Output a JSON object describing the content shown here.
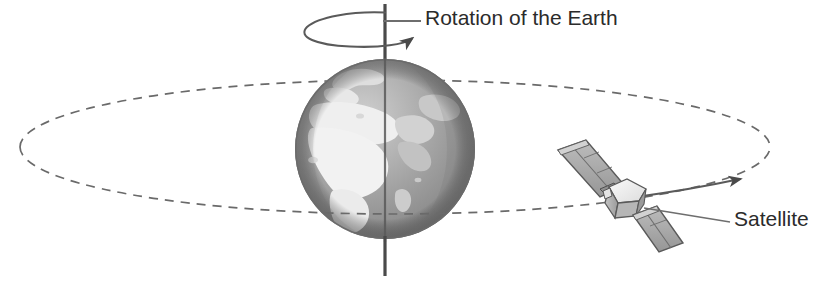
{
  "figure": {
    "background_color": "#ffffff",
    "width": 817,
    "height": 292
  },
  "labels": {
    "rotation": "Rotation of the Earth",
    "satellite": "Satellite"
  },
  "bottom_clipped_caption": "",
  "colors": {
    "line": "#555555",
    "orbit_dash": "#6a6a6a",
    "axis": "#4a4a4a",
    "text": "#2b2b2b",
    "globe_ocean_dark": "#8b8b8b",
    "globe_ocean_mid": "#a6a6a6",
    "globe_land_light": "#ededed",
    "globe_land_mid": "#cfcfcf",
    "globe_shadow": "#6f6f6f",
    "satellite_body_light": "#f2f2f2",
    "satellite_body_mid": "#c9c9c9",
    "satellite_body_dark": "#8e8e8e",
    "panel_fill": "#a9a9a9",
    "panel_stroke": "#5a5a5a"
  },
  "elements": {
    "earth_globe": {
      "name": "earth-globe",
      "center_x": 385,
      "center_y": 149,
      "radius_x": 90,
      "radius_y": 91,
      "continents_visible": "Africa, Europe, Middle East"
    },
    "rotation_axis": {
      "name": "rotation-axis",
      "x": 385,
      "y_top": 4,
      "y_bottom": 275
    },
    "rotation_arrow_ellipse": {
      "name": "rotation-direction-arrow",
      "center_x": 357,
      "center_y": 29,
      "radius_x": 52,
      "radius_y": 17,
      "arrow_direction": "clockwise-viewed-from-above"
    },
    "rotation_leader_line": {
      "name": "rotation-label-leader-line",
      "x1": 385,
      "y1": 21,
      "x2": 420,
      "y2": 21
    },
    "orbit_ellipse": {
      "name": "satellite-orbit-path",
      "center_x": 395,
      "center_y": 147,
      "radius_x": 375,
      "radius_y": 67,
      "style": "dashed"
    },
    "satellite": {
      "name": "satellite",
      "body_center_x": 625,
      "body_center_y": 200,
      "panel_angle_degrees": -38,
      "panel_count": 2
    },
    "satellite_direction_arrow": {
      "name": "satellite-direction-arrow",
      "from_x": 640,
      "from_y": 196,
      "to_x": 742,
      "to_y": 180
    },
    "satellite_leader_line": {
      "name": "satellite-label-leader-line",
      "x1": 648,
      "y1": 207,
      "x2": 728,
      "y2": 221
    }
  }
}
